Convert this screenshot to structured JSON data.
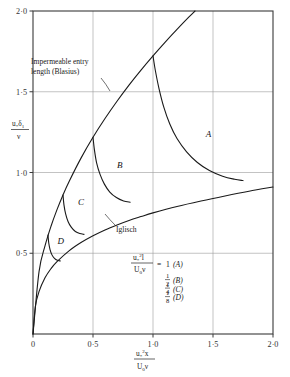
{
  "chart_data": {
    "type": "line",
    "title": "",
    "xlabel": "u*^2 x / (U0 v)",
    "ylabel": "u* d1 / v",
    "xlim": [
      0,
      2.0
    ],
    "ylim": [
      0,
      2.0
    ],
    "grid": true,
    "xticks": [
      0,
      0.5,
      1.0,
      1.5,
      2.0
    ],
    "xtick_labels": [
      "0",
      "0·5",
      "1·0",
      "1·5",
      "2·0"
    ],
    "yticks": [
      0.5,
      1.0,
      1.5,
      2.0
    ],
    "ytick_labels": [
      "0·5",
      "1·0",
      "1·5",
      "2·0"
    ],
    "legend_position": "none",
    "series": [
      {
        "name": "Impermeable entry length (Blasius)",
        "style": "solid",
        "points": [
          [
            0,
            0
          ],
          [
            0.05,
            0.385
          ],
          [
            0.1,
            0.545
          ],
          [
            0.15,
            0.667
          ],
          [
            0.2,
            0.77
          ],
          [
            0.25,
            0.861
          ],
          [
            0.3,
            0.943
          ],
          [
            0.4,
            1.089
          ],
          [
            0.5,
            1.218
          ],
          [
            0.6,
            1.334
          ],
          [
            0.7,
            1.441
          ],
          [
            0.8,
            1.541
          ],
          [
            0.9,
            1.634
          ],
          [
            1.0,
            1.722
          ],
          [
            1.1,
            1.806
          ],
          [
            1.2,
            1.886
          ],
          [
            1.3,
            1.963
          ],
          [
            1.35,
            2.0
          ]
        ]
      },
      {
        "name": "Iglisch",
        "style": "solid",
        "points": [
          [
            0,
            0
          ],
          [
            0.02,
            0.172
          ],
          [
            0.05,
            0.262
          ],
          [
            0.1,
            0.348
          ],
          [
            0.15,
            0.405
          ],
          [
            0.2,
            0.448
          ],
          [
            0.3,
            0.515
          ],
          [
            0.4,
            0.566
          ],
          [
            0.5,
            0.608
          ],
          [
            0.6,
            0.644
          ],
          [
            0.7,
            0.675
          ],
          [
            0.8,
            0.703
          ],
          [
            0.9,
            0.727
          ],
          [
            1.0,
            0.75
          ],
          [
            1.2,
            0.79
          ],
          [
            1.4,
            0.824
          ],
          [
            1.6,
            0.855
          ],
          [
            1.8,
            0.884
          ],
          [
            2.0,
            0.91
          ]
        ]
      },
      {
        "name": "A",
        "style": "solid",
        "points": [
          [
            1.0,
            1.722
          ],
          [
            1.02,
            1.63
          ],
          [
            1.05,
            1.52
          ],
          [
            1.09,
            1.405
          ],
          [
            1.14,
            1.3
          ],
          [
            1.2,
            1.21
          ],
          [
            1.28,
            1.128
          ],
          [
            1.37,
            1.062
          ],
          [
            1.47,
            1.012
          ],
          [
            1.58,
            0.977
          ],
          [
            1.68,
            0.958
          ],
          [
            1.75,
            0.95
          ]
        ]
      },
      {
        "name": "B",
        "style": "solid",
        "points": [
          [
            0.5,
            1.218
          ],
          [
            0.512,
            1.14
          ],
          [
            0.53,
            1.06
          ],
          [
            0.558,
            0.99
          ],
          [
            0.595,
            0.928
          ],
          [
            0.64,
            0.879
          ],
          [
            0.695,
            0.845
          ],
          [
            0.755,
            0.824
          ],
          [
            0.81,
            0.816
          ]
        ]
      },
      {
        "name": "C",
        "style": "solid",
        "points": [
          [
            0.25,
            0.861
          ],
          [
            0.258,
            0.8
          ],
          [
            0.272,
            0.744
          ],
          [
            0.292,
            0.697
          ],
          [
            0.32,
            0.66
          ],
          [
            0.353,
            0.635
          ],
          [
            0.39,
            0.622
          ],
          [
            0.425,
            0.617
          ]
        ]
      },
      {
        "name": "D",
        "style": "solid",
        "points": [
          [
            0.125,
            0.612
          ],
          [
            0.131,
            0.565
          ],
          [
            0.142,
            0.523
          ],
          [
            0.158,
            0.49
          ],
          [
            0.179,
            0.468
          ],
          [
            0.203,
            0.456
          ],
          [
            0.228,
            0.452
          ]
        ]
      }
    ],
    "annotations": [
      {
        "name": "blasius-label",
        "text_line1": "Impermeable entry",
        "text_line2": "length (Blasius)",
        "x": 0.07,
        "y": 1.78
      },
      {
        "name": "iglisch-label",
        "text": "Iglisch",
        "x": 0.63,
        "y": 0.685
      },
      {
        "name": "curve-label-a",
        "text": "A",
        "x": 1.44,
        "y": 1.22
      },
      {
        "name": "curve-label-b",
        "text": "B",
        "x": 0.7,
        "y": 1.03
      },
      {
        "name": "curve-label-c",
        "text": "C",
        "x": 0.375,
        "y": 0.8
      },
      {
        "name": "curve-label-d",
        "text": "D",
        "x": 0.205,
        "y": 0.555
      }
    ],
    "equation_block": {
      "numerator": "u*² l",
      "denominator": "U₀ ν",
      "equals_value": "1",
      "cases": [
        {
          "value": "1",
          "fraction_num": "",
          "fraction_den": "",
          "label": "(A)"
        },
        {
          "value": "½",
          "fraction_num": "1",
          "fraction_den": "2",
          "label": "(B)"
        },
        {
          "value": "¼",
          "fraction_num": "1",
          "fraction_den": "4",
          "label": "(C)"
        },
        {
          "value": "⅛",
          "fraction_num": "1",
          "fraction_den": "8",
          "label": "(D)"
        }
      ]
    }
  },
  "labels": {
    "blasius_line1": "Impermeable entry",
    "blasius_line2": "length (Blasius)",
    "iglisch": "Iglisch",
    "letter_a": "A",
    "letter_b": "B",
    "letter_c": "C",
    "letter_d": "D",
    "case_a": "(A)",
    "case_b": "(B)",
    "case_c": "(C)",
    "case_d": "(D)",
    "eq_equals": "=",
    "eq_one": "1",
    "frac_half_n": "1",
    "frac_half_d": "2",
    "frac_quarter_n": "1",
    "frac_quarter_d": "4",
    "frac_eighth_n": "1",
    "frac_eighth_d": "8"
  },
  "ticks": {
    "x": [
      "0",
      "0·5",
      "1·0",
      "1·5",
      "2·0"
    ],
    "y": [
      "0·5",
      "1·0",
      "1·5",
      "2·0"
    ]
  },
  "axis_labels": {
    "y_num_u": "u",
    "y_num_star": "*",
    "y_num_delta": "δ",
    "y_num_delta_sub": "1",
    "y_den": "ν",
    "x_num_u": "u",
    "x_num_star": "*",
    "x_num_sup": "2",
    "x_num_x": "x",
    "x_den_U": "U",
    "x_den_sub": "0",
    "x_den_nu": "ν",
    "eq_num_u": "u",
    "eq_num_star": "*",
    "eq_num_sup": "2",
    "eq_num_l": "l",
    "eq_den_U": "U",
    "eq_den_sub": "0",
    "eq_den_nu": "ν"
  },
  "colors": {
    "frame": "#3a3a3a",
    "grid": "#9a9a9a",
    "curve": "#1a1a1a",
    "text": "#222222",
    "background": "#ffffff"
  }
}
